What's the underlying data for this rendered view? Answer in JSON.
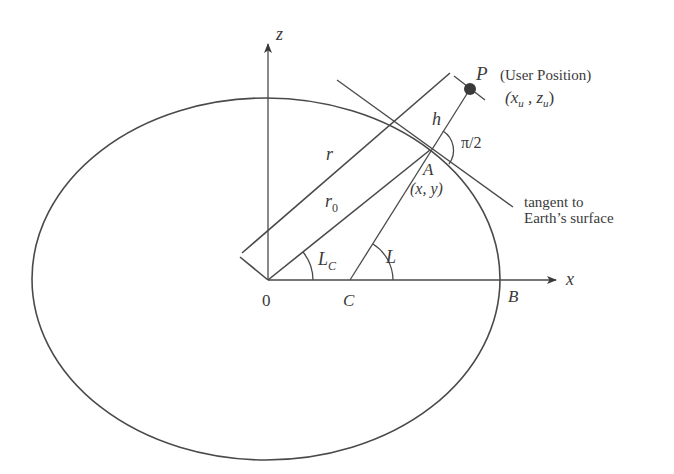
{
  "figure": {
    "type": "geometry diagram"
  },
  "axes": {
    "z_label": "z",
    "x_label": "x",
    "origin_label": "0"
  },
  "points": {
    "P": {
      "label": "P",
      "caption": "(User Position)",
      "coords": "(x",
      "coords_u": "u",
      "coords_sep": " , z",
      "coords_u2": "u",
      "coords_close": ")"
    },
    "A": {
      "label": "A",
      "coords": "(x, y)"
    },
    "B": {
      "label": "B"
    },
    "C": {
      "label": "C"
    }
  },
  "segments": {
    "r": "r",
    "r0": "r",
    "r0_sub": "0",
    "h": "h"
  },
  "angles": {
    "Lc": "L",
    "Lc_sub": "C",
    "L": "L",
    "right_angle": "π/2"
  },
  "annotations": {
    "tangent_line1": "tangent to",
    "tangent_line2": "Earth’s surface"
  },
  "colors": {
    "line": "#4a4a4a",
    "text": "#3a3a3a",
    "background": "#ffffff"
  }
}
